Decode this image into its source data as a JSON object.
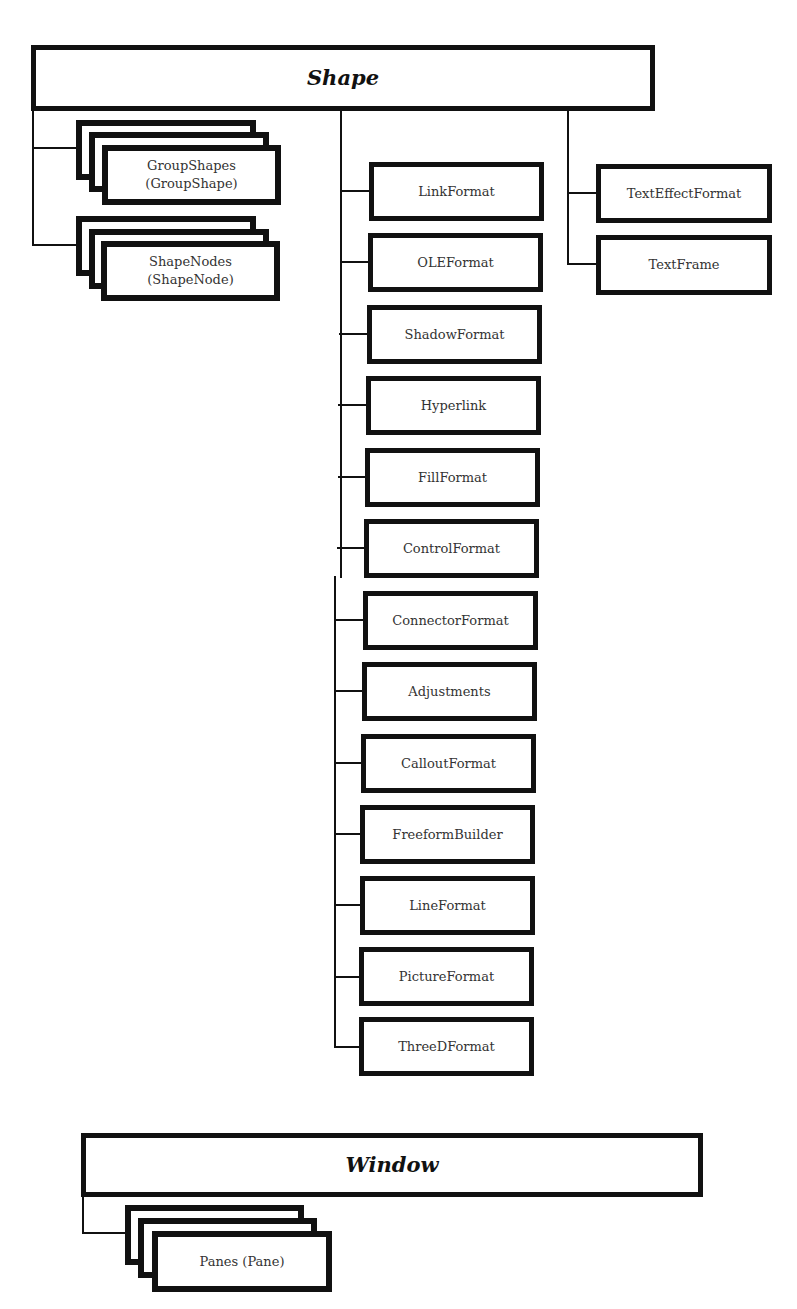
{
  "diagram": {
    "shape": {
      "title": "Shape",
      "collections": [
        {
          "label": "GroupShapes\n(GroupShape)",
          "name": "GroupShapes",
          "item": "GroupShape"
        },
        {
          "label": "ShapeNodes\n(ShapeNode)",
          "name": "ShapeNodes",
          "item": "ShapeNode"
        }
      ],
      "children": [
        "LinkFormat",
        "OLEFormat",
        "ShadowFormat",
        "Hyperlink",
        "FillFormat",
        "ControlFormat",
        "ConnectorFormat",
        "Adjustments",
        "CalloutFormat",
        "FreeformBuilder",
        "LineFormat",
        "PictureFormat",
        "ThreeDFormat"
      ],
      "text_children": [
        "TextEffectFormat",
        "TextFrame"
      ]
    },
    "window": {
      "title": "Window",
      "collections": [
        {
          "label": "Panes (Pane)",
          "name": "Panes",
          "item": "Pane"
        }
      ]
    }
  },
  "colors": {
    "stroke": "#111111",
    "text": "#333333",
    "background": "#ffffff"
  }
}
